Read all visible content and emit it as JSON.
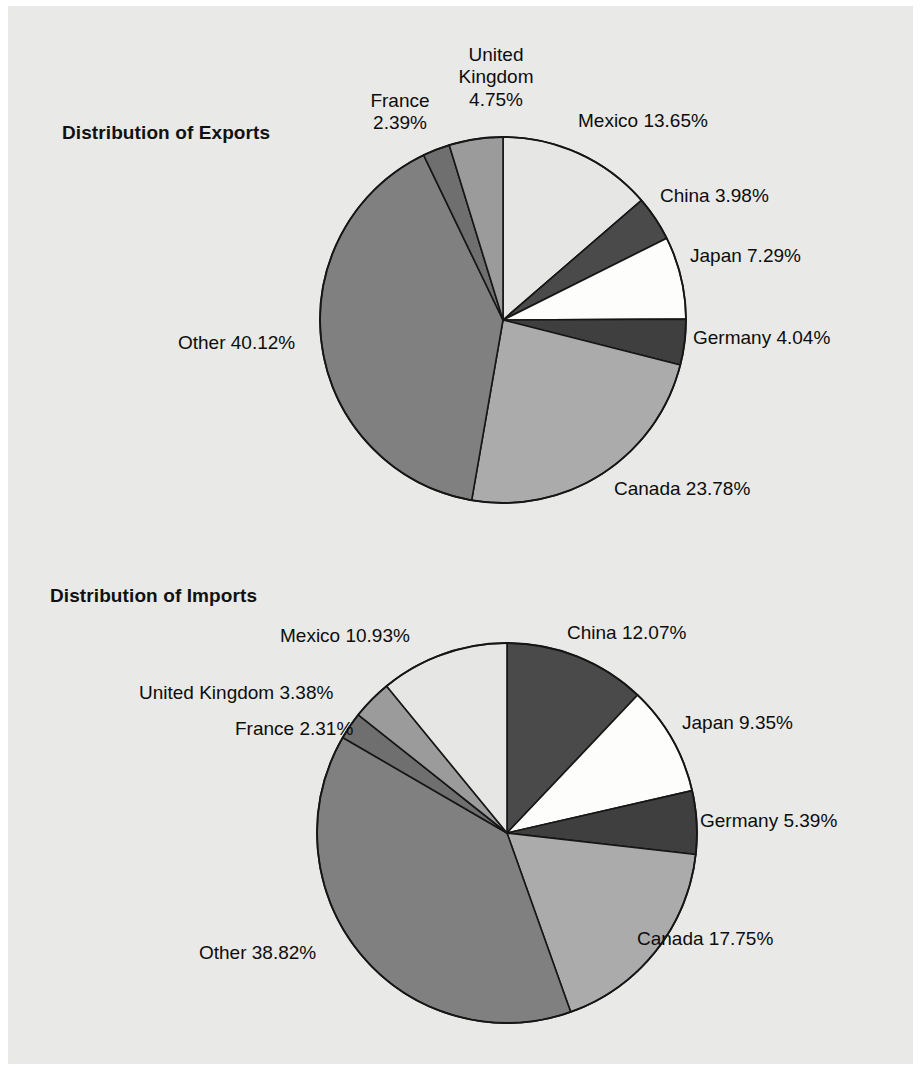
{
  "page": {
    "background": "#ffffff",
    "panel_color": "#e9e9e7"
  },
  "charts": [
    {
      "id": "exports",
      "title": "Distribution of Exports"
    },
    {
      "id": "imports",
      "title": "Distribution of Imports"
    }
  ],
  "labels": {
    "exports": {
      "mexico": "Mexico 13.65%",
      "china": "China 3.98%",
      "japan": "Japan 7.29%",
      "germany": "Germany 4.04%",
      "canada": "Canada 23.78%",
      "other": "Other 40.12%",
      "france": "France\n2.39%",
      "uk": "United\nKingdom\n4.75%"
    },
    "imports": {
      "mexico": "Mexico 10.93%",
      "uk": "United Kingdom 3.38%",
      "france": "France 2.31%",
      "china": "China 12.07%",
      "japan": "Japan 9.35%",
      "germany": "Germany 5.39%",
      "canada": "Canada 17.75%",
      "other": "Other 38.82%"
    }
  },
  "chart_data": [
    {
      "type": "pie",
      "title": "Distribution of Exports",
      "xlabel": "",
      "ylabel": "",
      "legend": "none",
      "labels_position": "outside-callout",
      "start_angle_deg": 0,
      "direction": "clockwise",
      "units": "percent",
      "categories": [
        "Mexico",
        "China",
        "Japan",
        "Germany",
        "Canada",
        "Other",
        "France",
        "United Kingdom"
      ],
      "values": [
        13.65,
        3.98,
        7.29,
        4.04,
        23.78,
        40.12,
        2.39,
        4.75
      ],
      "value_labels": [
        "13.65%",
        "3.98%",
        "7.29%",
        "4.04%",
        "23.78%",
        "40.12%",
        "2.39%",
        "4.75%"
      ],
      "colors": [
        "#e6e6e4",
        "#4a4a4a",
        "#fdfdfb",
        "#3f3f3f",
        "#ababab",
        "#808080",
        "#6f6f6f",
        "#9b9b9b"
      ],
      "total": 100.0
    },
    {
      "type": "pie",
      "title": "Distribution of Imports",
      "xlabel": "",
      "ylabel": "",
      "legend": "none",
      "labels_position": "outside-callout",
      "start_angle_deg": 0,
      "direction": "clockwise",
      "units": "percent",
      "categories": [
        "China",
        "Japan",
        "Germany",
        "Canada",
        "Other",
        "France",
        "United Kingdom",
        "Mexico"
      ],
      "values": [
        12.07,
        9.35,
        5.39,
        17.75,
        38.82,
        2.31,
        3.38,
        10.93
      ],
      "value_labels": [
        "12.07%",
        "9.35%",
        "5.39%",
        "17.75%",
        "38.82%",
        "2.31%",
        "3.38%",
        "10.93%"
      ],
      "colors": [
        "#4a4a4a",
        "#fdfdfb",
        "#3f3f3f",
        "#ababab",
        "#808080",
        "#6f6f6f",
        "#9b9b9b",
        "#e6e6e4"
      ],
      "total": 100.0
    }
  ],
  "geometry": {
    "exports_pie": {
      "cx": 503,
      "cy": 320,
      "r": 183
    },
    "imports_pie": {
      "cx": 507,
      "cy": 833,
      "r": 190
    }
  }
}
